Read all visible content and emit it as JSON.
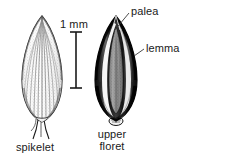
{
  "figure": {
    "type": "botanical-illustration",
    "background_color": "#ffffff",
    "ink_color": "#1a1a1a",
    "labels": {
      "palea": "palea",
      "lemma": "lemma",
      "spikelet": "spikelet",
      "upper_floret_line1": "upper",
      "upper_floret_line2": "floret",
      "upper_floret_full": "upper floret"
    },
    "scale_bar": {
      "label": "1 mm",
      "orientation": "vertical",
      "style": "i-beam",
      "top_y": 32,
      "bottom_y": 88,
      "x": 76
    },
    "specimens": [
      {
        "name": "spikelet",
        "position": "left",
        "tone": "light",
        "description": "ovate spikelet with fine longitudinal veins and stippled texture, acute apex, small pedicel at base"
      },
      {
        "name": "upper-floret",
        "position": "right",
        "tone": "dark",
        "description": "dark ovate floret, lemma forming dark margins, pale palea visible along the center flanked by white highlight stripes"
      }
    ],
    "leader_lines": [
      {
        "from": "palea",
        "to": "floret-apex-interior"
      },
      {
        "from": "lemma",
        "to": "floret-right-margin"
      }
    ]
  }
}
